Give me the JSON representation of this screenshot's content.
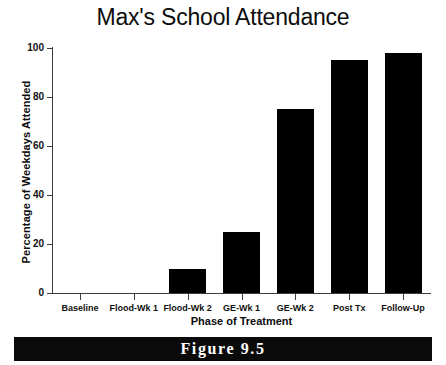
{
  "chart_data": {
    "type": "bar",
    "title": "Max's School Attendance",
    "xlabel": "Phase of Treatment",
    "ylabel": "Percentage of Weekdays Attended",
    "categories": [
      "Baseline",
      "Flood-Wk 1",
      "Flood-Wk 2",
      "GE-Wk 1",
      "GE-Wk 2",
      "Post Tx",
      "Follow-Up"
    ],
    "values": [
      0,
      0,
      10,
      25,
      75,
      95,
      98
    ],
    "ylim": [
      0,
      100
    ],
    "yticks": [
      0,
      20,
      40,
      60,
      80,
      100
    ],
    "ytick_labels": [
      "0",
      "20",
      "40",
      "60",
      "80",
      "100"
    ],
    "grid": false,
    "legend": null,
    "bar_color": "#000000",
    "axis_color": "#3a3a3a"
  },
  "figure": {
    "caption": "Figure 9.5",
    "band_color": "#0b0b0b",
    "caption_color": "#ffffff"
  }
}
